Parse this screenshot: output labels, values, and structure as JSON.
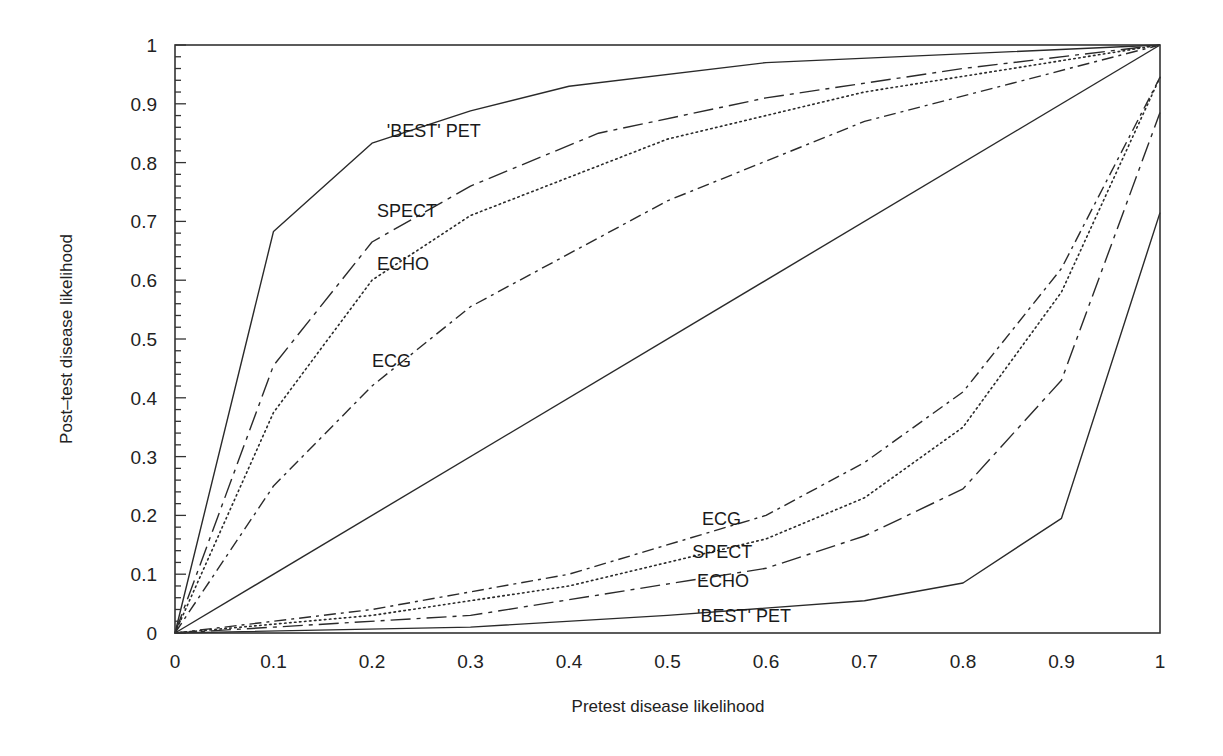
{
  "chart_data": {
    "type": "line",
    "title": "",
    "xlabel": "Pretest disease likelihood",
    "ylabel": "Post–test disease likelihood",
    "xlim": [
      0,
      1
    ],
    "ylim": [
      0,
      1
    ],
    "grid": false,
    "legend": "inline labels",
    "x_ticks": [
      "0",
      "0.1",
      "0.2",
      "0.3",
      "0.4",
      "0.5",
      "0.6",
      "0.7",
      "0.8",
      "0.9",
      "1"
    ],
    "y_ticks": [
      "0",
      "0.1",
      "0.2",
      "0.3",
      "0.4",
      "0.5",
      "0.6",
      "0.7",
      "0.8",
      "0.9",
      "1"
    ],
    "series": [
      {
        "name": "'BEST' PET (positive test)",
        "group": "upper",
        "style": "solid",
        "x": [
          0,
          0.1,
          0.2,
          0.3,
          0.4,
          0.6,
          1
        ],
        "y": [
          0,
          0.683,
          0.833,
          0.888,
          0.93,
          0.97,
          1
        ]
      },
      {
        "name": "SPECT (positive test)",
        "group": "upper",
        "style": "long-dash-dot",
        "x": [
          0,
          0.1,
          0.2,
          0.3,
          0.43,
          0.6,
          0.8,
          1
        ],
        "y": [
          0,
          0.455,
          0.665,
          0.76,
          0.85,
          0.91,
          0.96,
          1
        ]
      },
      {
        "name": "ECHO (positive test)",
        "group": "upper",
        "style": "dotted",
        "x": [
          0,
          0.1,
          0.2,
          0.3,
          0.5,
          0.7,
          0.85,
          1
        ],
        "y": [
          0,
          0.375,
          0.6,
          0.71,
          0.84,
          0.92,
          0.96,
          1
        ]
      },
      {
        "name": "ECG (positive test)",
        "group": "upper",
        "style": "dash-dot",
        "x": [
          0,
          0.1,
          0.2,
          0.3,
          0.5,
          0.7,
          0.85,
          1
        ],
        "y": [
          0,
          0.25,
          0.42,
          0.555,
          0.735,
          0.87,
          0.935,
          1
        ]
      },
      {
        "name": "Reference (no test)",
        "group": "diagonal",
        "style": "solid",
        "x": [
          0,
          1
        ],
        "y": [
          0,
          1
        ]
      },
      {
        "name": "ECG (negative test)",
        "group": "lower",
        "style": "dash-dot",
        "x": [
          0,
          0.2,
          0.4,
          0.6,
          0.7,
          0.8,
          0.9,
          1
        ],
        "y": [
          0,
          0.04,
          0.1,
          0.2,
          0.29,
          0.41,
          0.62,
          0.945
        ]
      },
      {
        "name": "SPECT (negative test)",
        "group": "lower",
        "style": "dotted",
        "x": [
          0,
          0.2,
          0.4,
          0.6,
          0.7,
          0.8,
          0.9,
          1
        ],
        "y": [
          0,
          0.03,
          0.08,
          0.16,
          0.23,
          0.35,
          0.58,
          0.945
        ]
      },
      {
        "name": "ECHO (negative test)",
        "group": "lower",
        "style": "long-dash-dot",
        "x": [
          0,
          0.3,
          0.6,
          0.7,
          0.8,
          0.9,
          1
        ],
        "y": [
          0,
          0.03,
          0.11,
          0.165,
          0.245,
          0.43,
          0.885
        ]
      },
      {
        "name": "'BEST' PET (negative test)",
        "group": "lower",
        "style": "solid",
        "x": [
          0,
          0.3,
          0.5,
          0.7,
          0.8,
          0.9,
          1
        ],
        "y": [
          0,
          0.01,
          0.03,
          0.055,
          0.085,
          0.195,
          0.715
        ]
      }
    ],
    "annotations": [
      {
        "text": "'BEST' PET",
        "x": 0.215,
        "y": 0.855
      },
      {
        "text": "SPECT",
        "x": 0.205,
        "y": 0.72
      },
      {
        "text": "ECHO",
        "x": 0.205,
        "y": 0.63
      },
      {
        "text": "ECG",
        "x": 0.2,
        "y": 0.465
      },
      {
        "text": "ECG",
        "x": 0.535,
        "y": 0.195
      },
      {
        "text": "SPECT",
        "x": 0.525,
        "y": 0.14
      },
      {
        "text": "ECHO",
        "x": 0.53,
        "y": 0.09
      },
      {
        "text": "'BEST' PET",
        "x": 0.53,
        "y": 0.03
      }
    ]
  },
  "labels": {
    "xlabel": "Pretest disease likelihood",
    "ylabel": "Post–test disease likelihood"
  }
}
